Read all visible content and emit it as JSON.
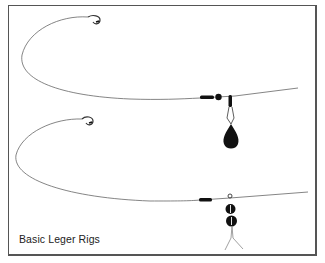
{
  "figure": {
    "caption": "Basic Leger Rigs",
    "colors": {
      "line": "#555555",
      "lead": "#111111",
      "frame": "#555555",
      "background": "#ffffff"
    },
    "rigs": [
      {
        "name": "Running leger with bead and pear-shaped lead",
        "components": [
          "hook",
          "line",
          "swivel",
          "bead",
          "link-swivel",
          "pear-lead"
        ]
      },
      {
        "name": "Link leger with split shot",
        "components": [
          "hook",
          "line",
          "swivel",
          "ring",
          "split-shot",
          "split-shot",
          "link-tails"
        ]
      }
    ]
  }
}
